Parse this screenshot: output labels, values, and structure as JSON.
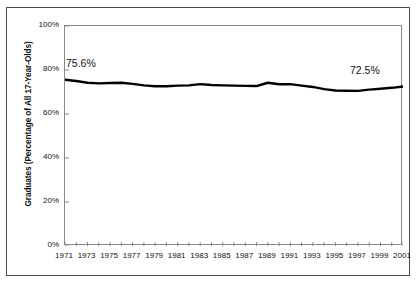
{
  "chart_data": {
    "type": "line",
    "title": "",
    "subtitle": "",
    "xlabel": "",
    "ylabel": "Graduates (Percentage of All 17-Year-Olds)",
    "xlim": [
      1971,
      2001
    ],
    "ylim": [
      0,
      100
    ],
    "grid": false,
    "legend": null,
    "y_ticks": [
      "0%",
      "20%",
      "40%",
      "60%",
      "80%",
      "100%"
    ],
    "y_tick_values": [
      0,
      20,
      40,
      60,
      80,
      100
    ],
    "x_ticks": [
      "1971",
      "1973",
      "1975",
      "1977",
      "1979",
      "1981",
      "1983",
      "1985",
      "1987",
      "1989",
      "1991",
      "1993",
      "1995",
      "1997",
      "1999",
      "2001"
    ],
    "x_tick_values": [
      1971,
      1973,
      1975,
      1977,
      1979,
      1981,
      1983,
      1985,
      1987,
      1989,
      1991,
      1993,
      1995,
      1997,
      1999,
      2001
    ],
    "x": [
      1971,
      1972,
      1973,
      1974,
      1975,
      1976,
      1977,
      1978,
      1979,
      1980,
      1981,
      1982,
      1983,
      1984,
      1985,
      1986,
      1987,
      1988,
      1989,
      1990,
      1991,
      1992,
      1993,
      1994,
      1995,
      1996,
      1997,
      1998,
      1999,
      2000,
      2001
    ],
    "series": [
      {
        "name": "Graduates (Percentage of All 17-Year-Olds)",
        "color": "#000000",
        "line_width": 2.4,
        "values": [
          75.6,
          75.0,
          74.2,
          73.9,
          74.1,
          74.2,
          73.7,
          73.0,
          72.6,
          72.6,
          72.9,
          73.0,
          73.6,
          73.2,
          73.0,
          72.9,
          72.8,
          72.7,
          74.2,
          73.5,
          73.6,
          72.9,
          72.3,
          71.3,
          70.7,
          70.6,
          70.5,
          71.1,
          71.5,
          71.9,
          72.5
        ]
      }
    ],
    "annotations": [
      {
        "name": "start-value",
        "text": "75.6%",
        "x": 1971,
        "y": 75.6
      },
      {
        "name": "end-value",
        "text": "72.5%",
        "x": 2001,
        "y": 72.5
      }
    ]
  }
}
